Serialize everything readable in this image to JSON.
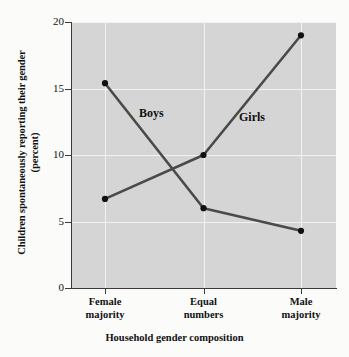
{
  "chart_data": {
    "type": "line",
    "title": "",
    "xlabel": "Household gender composition",
    "ylabel": "Children spontaneously reporting their gender",
    "ylabel_line2": "(percent)",
    "categories": [
      "Female majority",
      "Equal numbers",
      "Male majority"
    ],
    "category_lines": [
      [
        "Female",
        "majority"
      ],
      [
        "Equal",
        "numbers"
      ],
      [
        "Male",
        "majority"
      ]
    ],
    "series": [
      {
        "name": "Boys",
        "values": [
          15.4,
          6.0,
          4.3
        ]
      },
      {
        "name": "Girls",
        "values": [
          6.7,
          10.0,
          19.0
        ]
      }
    ],
    "ylim": [
      0,
      20
    ],
    "yticks": [
      0,
      5,
      10,
      15,
      20
    ],
    "ytick_labels": [
      "0",
      "5",
      "10",
      "15",
      "20"
    ],
    "grid": true,
    "legend": "inline-annotations",
    "colors": {
      "line": "#4a4a4a",
      "marker": "#101010",
      "plot_background": "#d5d5d5",
      "gridline": "#f2f2f2",
      "axis": "#3a3a3a",
      "page_background": "#fbfbfa"
    }
  }
}
